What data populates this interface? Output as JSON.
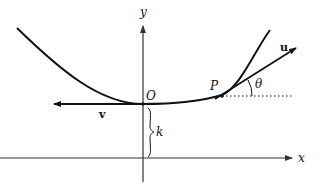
{
  "diagram": {
    "labels": {
      "y_axis": "y",
      "x_axis": "x",
      "origin": "O",
      "point": "P",
      "angle": "θ",
      "vector_u": "u",
      "vector_v": "v",
      "height": "k"
    },
    "colors": {
      "stroke": "#111111",
      "axis": "#333333",
      "background": "#ffffff"
    }
  }
}
